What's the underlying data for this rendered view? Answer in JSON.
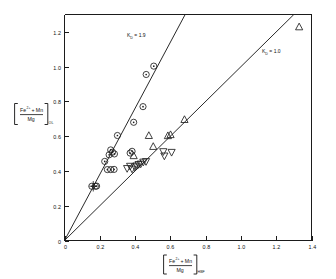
{
  "chart_data": {
    "type": "scatter",
    "title": "",
    "xlabel": "[Fe2+ + Mn / Mg]HBF",
    "ylabel": "[Fe2+ + Mn / Mg]OL",
    "xlabel_parts": {
      "numerator": "Fe",
      "numerator_sup": "2+",
      "numerator_plus": "+ Mn",
      "denominator": "Mg",
      "subscript": "HBF"
    },
    "ylabel_parts": {
      "numerator": "Fe",
      "numerator_sup": "2+",
      "numerator_plus": "+ Mn",
      "denominator": "Mg",
      "subscript": "OL"
    },
    "xlim": [
      0,
      1.4
    ],
    "ylim": [
      0,
      1.3
    ],
    "xticks": [
      "0",
      "0.2",
      "0.4",
      "0.6",
      "0.8",
      "1.0",
      "1.2",
      "1.4"
    ],
    "xtick_values": [
      0,
      0.2,
      0.4,
      0.6,
      0.8,
      1.0,
      1.2,
      1.4
    ],
    "yticks": [
      "0",
      "0.2",
      "0.4",
      "0.6",
      "0.8",
      "1.0",
      "1.2"
    ],
    "ytick_values": [
      0,
      0.2,
      0.4,
      0.6,
      0.8,
      1.0,
      1.2
    ],
    "grid": false,
    "legend": "none",
    "annotations": [
      {
        "name": "kd-1.9-label",
        "text": "K  = 1.9",
        "symbol": "K",
        "subscript": "D",
        "equals_value": "= 1.9",
        "x": 0.36,
        "y": 1.12
      },
      {
        "name": "kd-1.0-label",
        "text": "K  = 1.0",
        "symbol": "K",
        "subscript": "D",
        "equals_value": "= 1.0",
        "x": 1.03,
        "y": 1.02
      }
    ],
    "reference_lines": [
      {
        "name": "kd-1.9-line",
        "label": "KD = 1.9",
        "slope": 1.9,
        "intercept": 0,
        "x_start": 0.0,
        "x_end": 0.685,
        "y_start": 0.0,
        "y_end": 1.302
      },
      {
        "name": "kd-1.0-line",
        "label": "KD = 1.0",
        "slope": 1.0,
        "intercept": 0,
        "x_start": 0.0,
        "x_end": 1.3,
        "y_start": 0.0,
        "y_end": 1.3
      }
    ],
    "series": [
      {
        "name": "circle-dot-series",
        "marker": "circle-with-center-dot",
        "points": [
          [
            0.155,
            0.312
          ],
          [
            0.182,
            0.313
          ],
          [
            0.228,
            0.455
          ],
          [
            0.243,
            0.408
          ],
          [
            0.253,
            0.493
          ],
          [
            0.262,
            0.521
          ],
          [
            0.272,
            0.508
          ],
          [
            0.283,
            0.498
          ],
          [
            0.262,
            0.408
          ],
          [
            0.281,
            0.409
          ],
          [
            0.3,
            0.604
          ],
          [
            0.372,
            0.503
          ],
          [
            0.383,
            0.513
          ],
          [
            0.392,
            0.68
          ],
          [
            0.445,
            0.77
          ],
          [
            0.463,
            0.955
          ],
          [
            0.506,
            1.003
          ],
          [
            0.175,
            0.312
          ]
        ]
      },
      {
        "name": "triangle-up-series",
        "marker": "triangle-up",
        "points": [
          [
            0.392,
            0.487
          ],
          [
            0.478,
            0.603
          ],
          [
            0.503,
            0.54
          ],
          [
            0.586,
            0.602
          ],
          [
            0.601,
            0.608
          ],
          [
            0.68,
            0.695
          ],
          [
            1.33,
            1.228
          ]
        ]
      },
      {
        "name": "triangle-down-series",
        "marker": "triangle-down",
        "points": [
          [
            0.355,
            0.415
          ],
          [
            0.372,
            0.428
          ],
          [
            0.383,
            0.412
          ],
          [
            0.398,
            0.424
          ],
          [
            0.408,
            0.43
          ],
          [
            0.42,
            0.438
          ],
          [
            0.432,
            0.441
          ],
          [
            0.447,
            0.452
          ],
          [
            0.462,
            0.455
          ],
          [
            0.56,
            0.512
          ],
          [
            0.566,
            0.487
          ],
          [
            0.607,
            0.508
          ]
        ]
      }
    ],
    "error_bars": [
      {
        "name": "error-bar-left-cluster",
        "x": 0.163,
        "y": 0.312,
        "x_err": 0.022,
        "y_err": 0.03
      }
    ]
  }
}
